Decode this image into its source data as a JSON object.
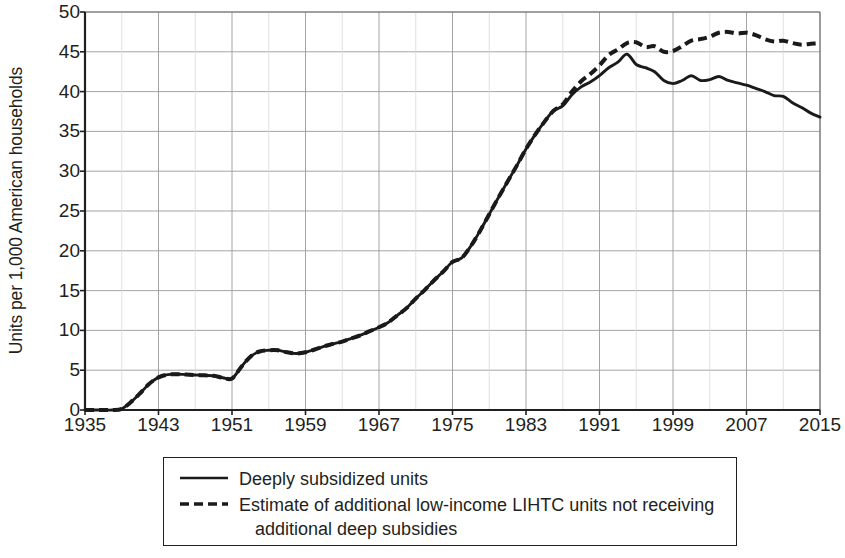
{
  "chart_data": {
    "type": "line",
    "title": "",
    "xlabel": "",
    "ylabel": "Units per 1,000 American households",
    "xlim": [
      1935,
      2015
    ],
    "ylim": [
      0,
      50
    ],
    "grid": true,
    "legend_position": "bottom",
    "xticks": [
      "1935",
      "1943",
      "1951",
      "1959",
      "1967",
      "1975",
      "1983",
      "1991",
      "1999",
      "2007",
      "2015"
    ],
    "yticks": [
      "0",
      "5",
      "10",
      "15",
      "20",
      "25",
      "30",
      "35",
      "40",
      "45",
      "50"
    ],
    "x": [
      1935,
      1936,
      1937,
      1938,
      1939,
      1940,
      1941,
      1942,
      1943,
      1944,
      1945,
      1946,
      1947,
      1948,
      1949,
      1950,
      1951,
      1952,
      1953,
      1954,
      1955,
      1956,
      1957,
      1958,
      1959,
      1960,
      1961,
      1962,
      1963,
      1964,
      1965,
      1966,
      1967,
      1968,
      1969,
      1970,
      1971,
      1972,
      1973,
      1974,
      1975,
      1976,
      1977,
      1978,
      1979,
      1980,
      1981,
      1982,
      1983,
      1984,
      1985,
      1986,
      1987,
      1988,
      1989,
      1990,
      1991,
      1992,
      1993,
      1994,
      1995,
      1996,
      1997,
      1998,
      1999,
      2000,
      2001,
      2002,
      2003,
      2004,
      2005,
      2006,
      2007,
      2008,
      2009,
      2010,
      2011,
      2012,
      2013,
      2014,
      2015
    ],
    "series": [
      {
        "name": "Deeply subsidized units",
        "style": "solid",
        "color": "#1a1a1a",
        "values": [
          0.0,
          0.0,
          0.0,
          0.0,
          0.15,
          1.0,
          2.1,
          3.3,
          4.1,
          4.45,
          4.5,
          4.45,
          4.4,
          4.35,
          4.3,
          4.05,
          3.95,
          5.4,
          6.7,
          7.35,
          7.5,
          7.5,
          7.25,
          7.1,
          7.25,
          7.6,
          8.0,
          8.3,
          8.6,
          9.0,
          9.4,
          9.9,
          10.4,
          11.0,
          11.9,
          12.8,
          14.0,
          15.1,
          16.3,
          17.4,
          18.6,
          19.1,
          20.6,
          22.5,
          24.6,
          26.7,
          28.7,
          30.7,
          32.8,
          34.6,
          36.2,
          37.6,
          38.2,
          39.6,
          40.6,
          41.2,
          42.0,
          43.0,
          43.7,
          44.7,
          43.4,
          43.0,
          42.5,
          41.4,
          41.0,
          41.4,
          42.0,
          41.4,
          41.5,
          41.9,
          41.4,
          41.1,
          40.8,
          40.4,
          40.0,
          39.5,
          39.4,
          38.6,
          38.0,
          37.3,
          36.8
        ]
      },
      {
        "name": "Estimate of additional low-income LIHTC units not receiving additional deep subsidies",
        "style": "dashed",
        "color": "#1a1a1a",
        "values": [
          0.0,
          0.0,
          0.0,
          0.0,
          0.15,
          1.0,
          2.1,
          3.3,
          4.1,
          4.45,
          4.5,
          4.45,
          4.4,
          4.35,
          4.3,
          4.05,
          3.95,
          5.4,
          6.7,
          7.35,
          7.5,
          7.5,
          7.25,
          7.1,
          7.25,
          7.6,
          8.0,
          8.3,
          8.6,
          9.0,
          9.4,
          9.9,
          10.4,
          11.0,
          11.9,
          12.8,
          14.0,
          15.1,
          16.3,
          17.4,
          18.6,
          19.1,
          20.6,
          22.5,
          24.6,
          26.7,
          28.7,
          30.7,
          32.8,
          34.6,
          36.2,
          37.6,
          38.4,
          40.0,
          41.3,
          42.2,
          43.3,
          44.6,
          45.3,
          46.1,
          46.2,
          45.6,
          45.7,
          45.0,
          45.1,
          45.7,
          46.4,
          46.6,
          46.9,
          47.4,
          47.5,
          47.3,
          47.4,
          47.1,
          46.6,
          46.3,
          46.4,
          46.1,
          45.9,
          46.0,
          46.1
        ]
      }
    ]
  },
  "legend": {
    "items": [
      {
        "label": "Deeply subsidized units",
        "label_line2": "",
        "style": "solid"
      },
      {
        "label": "Estimate of additional low-income LIHTC units not receiving",
        "label_line2": "additional deep subsidies",
        "style": "dashed"
      }
    ]
  }
}
